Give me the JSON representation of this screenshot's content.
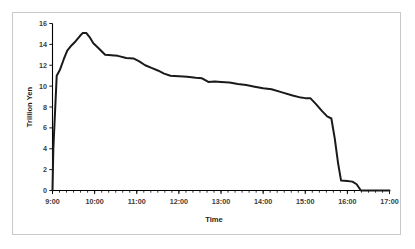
{
  "figure": {
    "background_color": "#ffffff",
    "border_color": "#c9c9c9",
    "line_color": "#1a1a1a"
  },
  "chart_data": {
    "type": "line",
    "title": "",
    "subtitle": "",
    "xlabel": "Time",
    "ylabel": "Trillion Yen",
    "xlim": [
      9.0,
      17.0
    ],
    "ylim": [
      0,
      16
    ],
    "grid": false,
    "legend": false,
    "legend_position": "none",
    "x_tick_labels": [
      "9:00",
      "10:00",
      "11:00",
      "12:00",
      "13:00",
      "14:00",
      "15:00",
      "16:00",
      "17:00"
    ],
    "x_tick_values": [
      9,
      10,
      11,
      12,
      13,
      14,
      15,
      16,
      17
    ],
    "x_minor_tick_interval_hours": 0.1667,
    "y_tick_labels": [
      "0",
      "2",
      "4",
      "6",
      "8",
      "10",
      "12",
      "14",
      "16"
    ],
    "y_tick_values": [
      0,
      2,
      4,
      6,
      8,
      10,
      12,
      14,
      16
    ],
    "series": [
      {
        "name": "Trillion Yen",
        "color": "#1a1a1a",
        "x": [
          8.7,
          9.0,
          9.02,
          9.1,
          9.18,
          9.27,
          9.35,
          9.45,
          9.55,
          9.65,
          9.72,
          9.8,
          9.88,
          9.97,
          10.1,
          10.25,
          10.4,
          10.55,
          10.75,
          10.92,
          11.05,
          11.2,
          11.35,
          11.5,
          11.65,
          11.8,
          12.0,
          12.2,
          12.4,
          12.55,
          12.7,
          12.85,
          13.0,
          13.2,
          13.4,
          13.6,
          13.8,
          14.0,
          14.2,
          14.45,
          14.7,
          14.9,
          15.0,
          15.12,
          15.25,
          15.4,
          15.52,
          15.62,
          15.7,
          15.78,
          15.85,
          16.0,
          16.12,
          16.22,
          16.32,
          17.0
        ],
        "y": [
          0.0,
          0.0,
          4.0,
          11.0,
          11.6,
          12.6,
          13.4,
          13.9,
          14.3,
          14.8,
          15.1,
          15.1,
          14.7,
          14.1,
          13.6,
          13.0,
          12.95,
          12.9,
          12.7,
          12.65,
          12.4,
          12.0,
          11.75,
          11.5,
          11.2,
          11.0,
          10.95,
          10.9,
          10.8,
          10.75,
          10.4,
          10.45,
          10.4,
          10.35,
          10.2,
          10.1,
          9.95,
          9.8,
          9.7,
          9.4,
          9.1,
          8.9,
          8.85,
          8.85,
          8.3,
          7.6,
          7.1,
          6.9,
          5.0,
          2.6,
          0.95,
          0.9,
          0.85,
          0.6,
          0.0,
          0.0
        ],
        "peak_value": 15.1,
        "peak_time": "9:43",
        "start_value": 0,
        "end_value": 0
      }
    ],
    "annotations": []
  }
}
